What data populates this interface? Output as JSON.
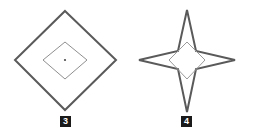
{
  "canvas": {
    "width": 254,
    "height": 134,
    "background": "#ffffff"
  },
  "figures": [
    {
      "id": "figure-3",
      "label": "3",
      "label_box_color": "#1a1a1a",
      "label_text_color": "#ffffff",
      "shape": "concentric-diamonds",
      "outer_stroke": "#5a5a5a",
      "outer_stroke_width": 2,
      "inner_stroke": "#8f8f8f",
      "inner_stroke_width": 1,
      "center_dot_color": "#4a4a4a",
      "outer_points": "65,11 116,60 65,110 15,60",
      "inner_points": "65,42 87,60 65,79 43,60",
      "center": {
        "x": 65,
        "y": 60
      }
    },
    {
      "id": "figure-4",
      "label": "4",
      "label_box_color": "#1a1a1a",
      "label_text_color": "#ffffff",
      "shape": "four-pointed-star",
      "outer_stroke": "#5a5a5a",
      "outer_stroke_width": 2,
      "inner_stroke": "#9a9a9a",
      "inner_stroke_width": 1,
      "star_points": "187,10 196,51 235,60 196,69 187,112 178,69 139,60 178,51",
      "inner_points": "187,42 205,60 187,79 169,60",
      "center": {
        "x": 187,
        "y": 60
      }
    }
  ]
}
